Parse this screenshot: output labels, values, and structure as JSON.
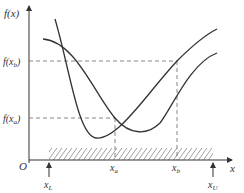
{
  "diagram": {
    "type": "function-interval-search",
    "y_axis_label": "f(x)",
    "x_axis_label": "x",
    "origin_label": "O",
    "y_ticks": [
      {
        "label": "f(x_b)",
        "display_main": "f(x",
        "display_sub": "b",
        "display_end": ")"
      },
      {
        "label": "f(x_a)",
        "display_main": "f(x",
        "display_sub": "a",
        "display_end": ")"
      }
    ],
    "x_ticks": [
      {
        "label": "x_a",
        "main": "x",
        "sub": "a"
      },
      {
        "label": "x_b",
        "main": "x",
        "sub": "b"
      }
    ],
    "bounds": [
      {
        "label": "x_L",
        "main": "x",
        "sub": "L"
      },
      {
        "label": "x_U",
        "main": "x",
        "sub": "U"
      }
    ],
    "curves": [
      {
        "name": "curve-1",
        "description": "steep V-shaped curve with minimum left of x_a"
      },
      {
        "name": "curve-2",
        "description": "wide curve descending from top-left with minimum right of x_a"
      }
    ],
    "colors": {
      "stroke": "#333333",
      "dashed": "#555555",
      "hatch": "#444444"
    }
  }
}
